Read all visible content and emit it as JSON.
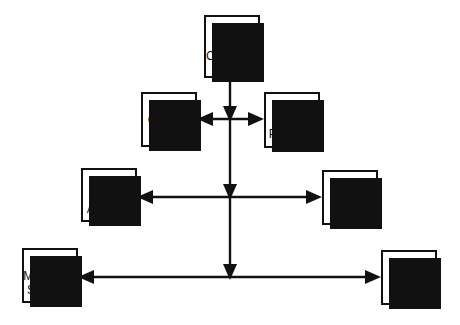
{
  "diagram": {
    "type": "organization-chart",
    "style": {
      "box_fill": "#ffffff",
      "box_border": "#111111",
      "shadow_color": "#111111",
      "line_color": "#111111",
      "background": "#ffffff"
    },
    "nodes": [
      {
        "number": "1",
        "label_lines": [
          "Controller"
        ],
        "x": 204,
        "y": 15,
        "w": 56,
        "h": 63,
        "number_offset": 8
      },
      {
        "number": "2",
        "label_lines": [
          "General",
          "Acctg."
        ],
        "x": 141,
        "y": 92,
        "w": 56,
        "h": 55,
        "number_offset": 2
      },
      {
        "number": "3",
        "label_lines": [
          "Fin'l",
          "Planning"
        ],
        "x": 264,
        "y": 92,
        "w": 56,
        "h": 56,
        "number_offset": 2
      },
      {
        "number": "4",
        "label_lines": [
          "Fin'l",
          "Analysis"
        ],
        "x": 81,
        "y": 168,
        "w": 56,
        "h": 54,
        "number_offset": 2
      },
      {
        "number": "5",
        "label_lines": [
          "Taxes"
        ],
        "x": 322,
        "y": 170,
        "w": 56,
        "h": 55,
        "number_offset": 8
      },
      {
        "number": "6",
        "label_lines": [
          "Mgmt Info",
          "Systems"
        ],
        "x": 22,
        "y": 248,
        "w": 56,
        "h": 55,
        "number_offset": 2
      },
      {
        "number": "7",
        "label_lines": [
          "Cost",
          "Acctg."
        ],
        "x": 381,
        "y": 250,
        "w": 56,
        "h": 55,
        "number_offset": 2
      }
    ],
    "connections": [
      {
        "name": "trunk-controller-to-level1",
        "from": "1",
        "to": "level-1-junction",
        "orientation": "vertical",
        "arrow": "down"
      },
      {
        "name": "level1-left-to-general-acctg",
        "from": "1",
        "to": "2",
        "orientation": "horizontal",
        "arrow": "left"
      },
      {
        "name": "level1-right-to-finl-planning",
        "from": "1",
        "to": "3",
        "orientation": "horizontal",
        "arrow": "right"
      },
      {
        "name": "trunk-level1-to-level2",
        "from": "level-1-junction",
        "to": "level-2-junction",
        "orientation": "vertical",
        "arrow": "down"
      },
      {
        "name": "level2-left-to-finl-analysis",
        "from": "1",
        "to": "4",
        "orientation": "horizontal",
        "arrow": "left"
      },
      {
        "name": "level2-right-to-taxes",
        "from": "1",
        "to": "5",
        "orientation": "horizontal",
        "arrow": "right"
      },
      {
        "name": "trunk-level2-to-level3",
        "from": "level-2-junction",
        "to": "level-3-junction",
        "orientation": "vertical",
        "arrow": "down"
      },
      {
        "name": "level3-left-to-mgmt-info-systems",
        "from": "1",
        "to": "6",
        "orientation": "horizontal",
        "arrow": "left"
      },
      {
        "name": "level3-right-to-cost-acctg",
        "from": "1",
        "to": "7",
        "orientation": "horizontal",
        "arrow": "right"
      }
    ]
  }
}
